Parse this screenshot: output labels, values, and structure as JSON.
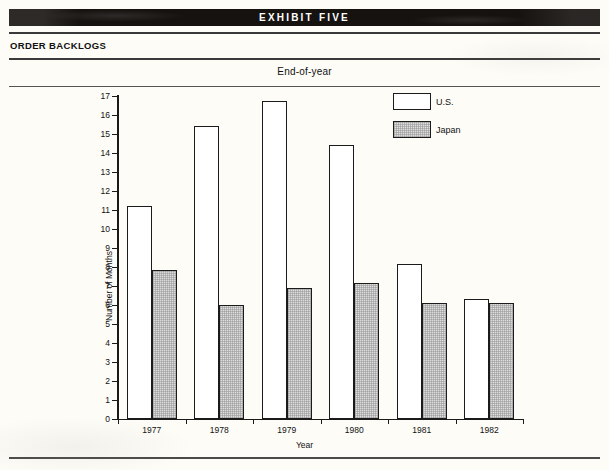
{
  "banner": {
    "text": "EXHIBIT FIVE"
  },
  "section": {
    "title": "ORDER BACKLOGS"
  },
  "chart_data": {
    "type": "bar",
    "title": "End-of-year",
    "xlabel": "Year",
    "ylabel": "Number of Months",
    "categories": [
      "1977",
      "1978",
      "1979",
      "1980",
      "1981",
      "1982"
    ],
    "series": [
      {
        "name": "U.S.",
        "color": "#ffffff",
        "values": [
          11.2,
          15.4,
          16.75,
          14.4,
          8.15,
          6.3
        ]
      },
      {
        "name": "Japan",
        "color": "#dedede",
        "values": [
          7.85,
          6.0,
          6.9,
          7.15,
          6.1,
          6.1
        ]
      }
    ],
    "ylim": [
      0,
      17
    ],
    "yticks": [
      "0",
      "1",
      "2",
      "3",
      "4",
      "5",
      "6",
      "7",
      "8",
      "9",
      "10",
      "11",
      "12",
      "13",
      "14",
      "15",
      "16",
      "17"
    ],
    "grid": false,
    "legend_position": "top-right"
  }
}
